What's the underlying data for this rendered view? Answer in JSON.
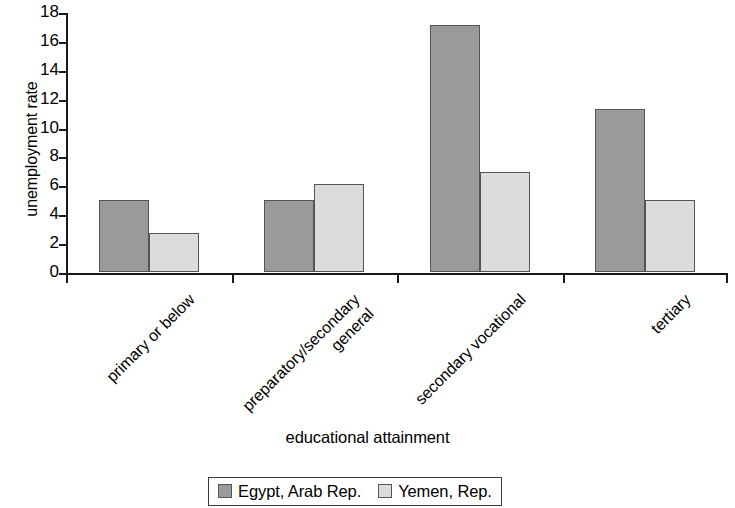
{
  "chart_data": {
    "type": "bar",
    "title": "",
    "xlabel": "educational attainment",
    "ylabel": "unemployment rate",
    "ylim": [
      0,
      18
    ],
    "ytick_step": 2,
    "yticks": [
      0,
      2,
      4,
      6,
      8,
      10,
      12,
      14,
      16,
      18
    ],
    "grid": false,
    "legend_position": "bottom",
    "categories": [
      "primary or below",
      "preparatory/secondary\ngeneral",
      "secondary vocational",
      "tertiary"
    ],
    "series": [
      {
        "name": "Egypt, Arab Rep.",
        "color": "#9a9a9a",
        "values": [
          5.0,
          5.0,
          17.1,
          11.3
        ]
      },
      {
        "name": "Yemen, Rep.",
        "color": "#dcdcdc",
        "values": [
          2.7,
          6.1,
          6.9,
          5.0
        ]
      }
    ]
  },
  "colors": {
    "axis": "#1a1a1a",
    "bar_border": "#555555",
    "background": "#ffffff"
  }
}
